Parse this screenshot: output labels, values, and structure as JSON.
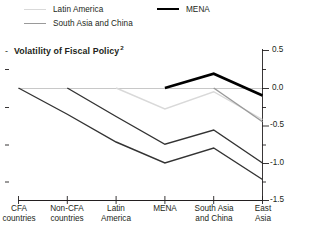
{
  "legend": {
    "items": [
      {
        "id": "latin-america",
        "label": "Latin America",
        "color": "#d9d9d9",
        "width": 1.2
      },
      {
        "id": "south-asia-china",
        "label": "South Asia and China",
        "color": "#9a9a9a",
        "width": 1.4
      },
      {
        "id": "mena",
        "label": "MENA",
        "color": "#000000",
        "width": 2.6
      }
    ]
  },
  "title": {
    "dash": "-",
    "text": "Volatility of Fiscal Policy",
    "superscript": "2"
  },
  "axis": {
    "y_title": "Real GDP per capita growth rate volatility",
    "y_ticks": [
      "0.5",
      "0.0",
      "-0.5",
      "-1.0",
      "-1.5"
    ]
  },
  "chart_data": {
    "type": "line",
    "title": "Volatility of Fiscal Policy",
    "xlabel": "",
    "ylabel": "Real GDP per capita growth rate volatility",
    "ylim": [
      -1.5,
      0.5
    ],
    "yticks": [
      0.5,
      0.0,
      -0.5,
      -1.0,
      -1.5
    ],
    "minor_ticks": true,
    "grid": false,
    "legend_position": "top",
    "categories": [
      "CFA countries",
      "Non-CFA countries",
      "Latin America",
      "MENA",
      "South Asia and China",
      "East Asia"
    ],
    "series": [
      {
        "name": "CFA countries",
        "color": "#333333",
        "width": 1.4,
        "x": [
          "CFA countries",
          "Non-CFA countries",
          "Latin America",
          "MENA",
          "South Asia and China",
          "East Asia"
        ],
        "values": [
          0.0,
          -0.35,
          -0.72,
          -1.0,
          -0.8,
          -1.22
        ]
      },
      {
        "name": "Non-CFA countries",
        "color": "#333333",
        "width": 1.4,
        "x": [
          "Non-CFA countries",
          "Latin America",
          "MENA",
          "South Asia and China",
          "East Asia"
        ],
        "values": [
          0.0,
          -0.38,
          -0.75,
          -0.56,
          -1.0
        ]
      },
      {
        "name": "Latin America",
        "color": "#d9d9d9",
        "width": 1.4,
        "x": [
          "Latin America",
          "MENA",
          "South Asia and China",
          "East Asia"
        ],
        "values": [
          0.0,
          -0.28,
          -0.05,
          -0.42
        ]
      },
      {
        "name": "South Asia and China",
        "color": "#9a9a9a",
        "width": 1.5,
        "x": [
          "South Asia and China",
          "East Asia"
        ],
        "values": [
          0.0,
          -0.45
        ]
      },
      {
        "name": "MENA",
        "color": "#000000",
        "width": 2.6,
        "x": [
          "MENA",
          "South Asia and China",
          "East Asia"
        ],
        "values": [
          0.0,
          0.19,
          -0.1
        ]
      }
    ]
  }
}
